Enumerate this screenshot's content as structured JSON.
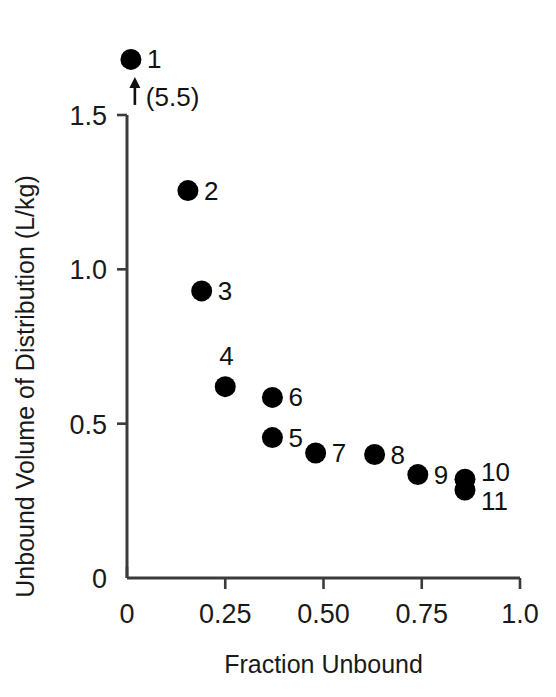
{
  "chart_data": {
    "type": "scatter",
    "title": "",
    "xlabel": "Fraction Unbound",
    "ylabel": "Unbound Volume of Distribution (L/kg)",
    "xlim": [
      0,
      1.0
    ],
    "ylim": [
      0,
      1.5
    ],
    "grid": false,
    "legend": "none",
    "xticks": [
      "0",
      "0.25",
      "0.50",
      "0.75",
      "1.0"
    ],
    "xtick_values": [
      0,
      0.25,
      0.5,
      0.75,
      1.0
    ],
    "yticks": [
      "0",
      "0.5",
      "1.0",
      "1.5"
    ],
    "ytick_values": [
      0,
      0.5,
      1.0,
      1.5
    ],
    "marker": "filled-circle",
    "marker_color": "#000000",
    "points": [
      {
        "label": "1",
        "x": 0.01,
        "y": 1.68,
        "label_dx": 16,
        "label_dy": 9,
        "offscale": true
      },
      {
        "label": "2",
        "x": 0.155,
        "y": 1.255,
        "label_dx": 16,
        "label_dy": 9,
        "offscale": false
      },
      {
        "label": "3",
        "x": 0.19,
        "y": 0.93,
        "label_dx": 16,
        "label_dy": 9,
        "offscale": false
      },
      {
        "label": "4",
        "x": 0.25,
        "y": 0.62,
        "label_dx": -6,
        "label_dy": -22,
        "offscale": false
      },
      {
        "label": "5",
        "x": 0.37,
        "y": 0.455,
        "label_dx": 16,
        "label_dy": 9,
        "offscale": false
      },
      {
        "label": "6",
        "x": 0.37,
        "y": 0.585,
        "label_dx": 16,
        "label_dy": 9,
        "offscale": false
      },
      {
        "label": "7",
        "x": 0.48,
        "y": 0.405,
        "label_dx": 16,
        "label_dy": 9,
        "offscale": false
      },
      {
        "label": "8",
        "x": 0.63,
        "y": 0.4,
        "label_dx": 16,
        "label_dy": 9,
        "offscale": false
      },
      {
        "label": "9",
        "x": 0.74,
        "y": 0.335,
        "label_dx": 16,
        "label_dy": 9,
        "offscale": false
      },
      {
        "label": "10",
        "x": 0.86,
        "y": 0.32,
        "label_dx": 16,
        "label_dy": 2,
        "offscale": false
      },
      {
        "label": "11",
        "x": 0.86,
        "y": 0.285,
        "label_dx": 16,
        "label_dy": 20,
        "offscale": false
      }
    ],
    "annotations": [
      {
        "name": "offscale-note",
        "text": "(5.5)",
        "x": 0.02,
        "y": 1.565,
        "arrow": "up"
      }
    ]
  }
}
